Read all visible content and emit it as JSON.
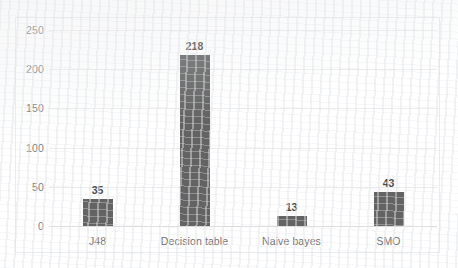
{
  "chart_data": {
    "type": "bar",
    "title": "",
    "subtitle": "",
    "xlabel": "",
    "ylabel": "",
    "categories": [
      "J48",
      "Decision table",
      "Naive bayes",
      "SMO"
    ],
    "values": [
      35,
      218,
      13,
      43
    ],
    "data_labels": [
      "35",
      "218",
      "13",
      "43"
    ],
    "ylim": [
      0,
      250
    ],
    "ytick_labels": [
      "0",
      "50",
      "100",
      "150",
      "200",
      "250"
    ],
    "ytick_values": [
      0,
      50,
      100,
      150,
      200,
      250
    ],
    "grid": "horizontal",
    "legend": "none",
    "series": [
      {
        "name": "",
        "values": [
          35,
          218,
          13,
          43
        ]
      }
    ],
    "colors": {
      "bar": "#636363",
      "gridline": "#ececec",
      "plot_border": "#e9ebee",
      "axis_label": "#6f6f6f",
      "data_label": "#4a4a4a",
      "background": "#ffffff"
    }
  }
}
